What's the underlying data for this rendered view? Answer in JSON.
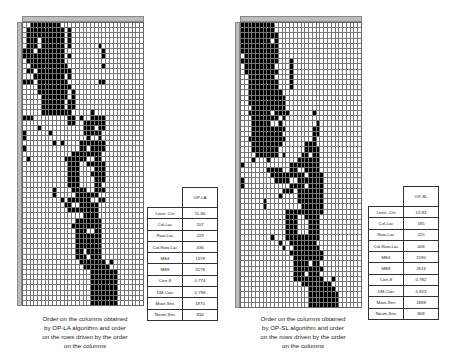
{
  "panels": [
    {
      "id": "op-la",
      "algorithm": "OP-LA",
      "matrix": {
        "cols": 32,
        "rows": 55,
        "runs": [
          [
            0,
            2,
            4
          ],
          [
            0,
            5,
            9
          ],
          [
            1,
            1,
            10
          ],
          [
            1,
            12,
            12
          ],
          [
            2,
            1,
            10
          ],
          [
            2,
            12,
            12
          ],
          [
            3,
            1,
            3
          ],
          [
            3,
            5,
            10
          ],
          [
            3,
            12,
            12
          ],
          [
            4,
            1,
            3
          ],
          [
            4,
            5,
            10
          ],
          [
            4,
            12,
            12
          ],
          [
            4,
            20,
            20
          ],
          [
            5,
            0,
            2
          ],
          [
            5,
            4,
            10
          ],
          [
            5,
            21,
            21
          ],
          [
            6,
            0,
            10
          ],
          [
            6,
            12,
            12
          ],
          [
            6,
            21,
            21
          ],
          [
            7,
            1,
            10
          ],
          [
            8,
            2,
            11
          ],
          [
            8,
            21,
            21
          ],
          [
            9,
            1,
            2
          ],
          [
            9,
            4,
            12
          ],
          [
            10,
            3,
            10
          ],
          [
            10,
            12,
            12
          ],
          [
            11,
            0,
            2
          ],
          [
            11,
            4,
            11
          ],
          [
            11,
            20,
            21
          ],
          [
            12,
            4,
            12
          ],
          [
            13,
            4,
            11
          ],
          [
            13,
            13,
            13
          ],
          [
            14,
            5,
            10
          ],
          [
            14,
            11,
            11
          ],
          [
            14,
            13,
            13
          ],
          [
            15,
            5,
            10
          ],
          [
            15,
            12,
            13
          ],
          [
            16,
            5,
            10
          ],
          [
            16,
            12,
            13
          ],
          [
            17,
            5,
            12
          ],
          [
            17,
            18,
            18
          ],
          [
            18,
            0,
            2
          ],
          [
            18,
            12,
            13
          ],
          [
            18,
            15,
            15
          ],
          [
            18,
            18,
            21
          ],
          [
            19,
            12,
            13
          ],
          [
            19,
            16,
            21
          ],
          [
            20,
            4,
            4
          ],
          [
            20,
            16,
            18
          ],
          [
            20,
            20,
            21
          ],
          [
            21,
            0,
            0
          ],
          [
            21,
            7,
            7
          ],
          [
            21,
            16,
            20
          ],
          [
            22,
            0,
            0
          ],
          [
            22,
            17,
            17
          ],
          [
            22,
            20,
            20
          ],
          [
            23,
            8,
            8
          ],
          [
            23,
            10,
            10
          ],
          [
            23,
            15,
            21
          ],
          [
            24,
            0,
            0
          ],
          [
            24,
            15,
            16
          ],
          [
            24,
            18,
            21
          ],
          [
            25,
            13,
            20
          ],
          [
            26,
            1,
            1
          ],
          [
            26,
            11,
            16
          ],
          [
            26,
            19,
            20
          ],
          [
            27,
            12,
            14
          ],
          [
            27,
            17,
            21
          ],
          [
            28,
            12,
            14
          ],
          [
            28,
            19,
            21
          ],
          [
            29,
            12,
            14
          ],
          [
            29,
            18,
            21
          ],
          [
            30,
            12,
            14
          ],
          [
            30,
            19,
            21
          ],
          [
            31,
            12,
            14
          ],
          [
            31,
            19,
            20
          ],
          [
            32,
            8,
            8
          ],
          [
            32,
            13,
            16
          ],
          [
            32,
            19,
            21
          ],
          [
            33,
            8,
            8
          ],
          [
            33,
            14,
            19
          ],
          [
            34,
            10,
            10
          ],
          [
            34,
            12,
            17
          ],
          [
            34,
            20,
            21
          ],
          [
            35,
            11,
            12
          ],
          [
            35,
            15,
            19
          ],
          [
            36,
            12,
            19
          ],
          [
            37,
            16,
            19
          ],
          [
            38,
            14,
            20
          ],
          [
            39,
            13,
            14
          ],
          [
            39,
            15,
            20
          ],
          [
            40,
            14,
            16
          ],
          [
            40,
            19,
            20
          ],
          [
            41,
            14,
            20
          ],
          [
            42,
            14,
            20
          ],
          [
            43,
            14,
            20
          ],
          [
            44,
            14,
            15
          ],
          [
            44,
            17,
            20
          ],
          [
            45,
            14,
            16
          ],
          [
            45,
            18,
            20
          ],
          [
            46,
            15,
            21
          ],
          [
            46,
            23,
            23
          ],
          [
            47,
            16,
            22
          ],
          [
            48,
            18,
            24
          ],
          [
            49,
            18,
            24
          ],
          [
            50,
            18,
            24
          ],
          [
            51,
            18,
            24
          ],
          [
            52,
            18,
            24
          ],
          [
            53,
            18,
            24
          ],
          [
            54,
            18,
            24
          ]
        ]
      },
      "table": {
        "header": "OP-LA",
        "rows": [
          {
            "label": "Lenn- Crit",
            "value": "11.66"
          },
          {
            "label": "Col-Lac",
            "value": "207"
          },
          {
            "label": "Row-Lac",
            "value": "229"
          },
          {
            "label": "Col-Row-Lac",
            "value": "436"
          },
          {
            "label": "ME4",
            "value": "1378"
          },
          {
            "label": "ME8",
            "value": "2578"
          },
          {
            "label": "Corr-8",
            "value": "0.774"
          },
          {
            "label": "DM-Corr",
            "value": "0.798"
          },
          {
            "label": "Moor-Strs",
            "value": "1970"
          },
          {
            "label": "Neum-Strs",
            "value": "834"
          }
        ]
      },
      "caption": [
        "Order on the columns obtained",
        "by OP-LA algorithm and order",
        "on the rows driven by the order",
        "on the columns"
      ]
    },
    {
      "id": "op-sl",
      "algorithm": "OP-SL",
      "matrix": {
        "cols": 32,
        "rows": 55,
        "runs": [
          [
            0,
            0,
            8
          ],
          [
            1,
            0,
            8
          ],
          [
            2,
            0,
            9
          ],
          [
            3,
            0,
            7
          ],
          [
            3,
            9,
            9
          ],
          [
            4,
            0,
            9
          ],
          [
            5,
            0,
            9
          ],
          [
            6,
            1,
            9
          ],
          [
            7,
            0,
            9
          ],
          [
            7,
            13,
            13
          ],
          [
            8,
            1,
            8
          ],
          [
            8,
            13,
            13
          ],
          [
            9,
            1,
            9
          ],
          [
            9,
            13,
            13
          ],
          [
            10,
            2,
            8
          ],
          [
            10,
            13,
            13
          ],
          [
            11,
            2,
            9
          ],
          [
            11,
            13,
            13
          ],
          [
            12,
            2,
            9
          ],
          [
            12,
            13,
            13
          ],
          [
            13,
            2,
            10
          ],
          [
            14,
            2,
            11
          ],
          [
            15,
            2,
            11
          ],
          [
            16,
            3,
            11
          ],
          [
            17,
            2,
            7
          ],
          [
            17,
            9,
            12
          ],
          [
            17,
            19,
            19
          ],
          [
            18,
            3,
            9
          ],
          [
            18,
            11,
            11
          ],
          [
            19,
            3,
            7
          ],
          [
            19,
            10,
            10
          ],
          [
            19,
            20,
            20
          ],
          [
            20,
            3,
            11
          ],
          [
            20,
            19,
            20
          ],
          [
            21,
            3,
            10
          ],
          [
            21,
            19,
            20
          ],
          [
            22,
            2,
            11
          ],
          [
            22,
            19,
            19
          ],
          [
            23,
            3,
            10
          ],
          [
            23,
            17,
            19
          ],
          [
            24,
            3,
            9
          ],
          [
            24,
            17,
            20
          ],
          [
            25,
            4,
            9
          ],
          [
            25,
            11,
            11
          ],
          [
            25,
            16,
            17
          ],
          [
            25,
            19,
            20
          ],
          [
            26,
            3,
            3
          ],
          [
            26,
            7,
            7
          ],
          [
            26,
            15,
            20
          ],
          [
            27,
            0,
            0
          ],
          [
            27,
            13,
            20
          ],
          [
            28,
            7,
            10
          ],
          [
            28,
            13,
            14
          ],
          [
            28,
            17,
            20
          ],
          [
            29,
            8,
            13
          ],
          [
            29,
            14,
            16
          ],
          [
            29,
            18,
            21
          ],
          [
            30,
            0,
            0
          ],
          [
            30,
            9,
            12
          ],
          [
            30,
            15,
            21
          ],
          [
            31,
            0,
            0
          ],
          [
            31,
            13,
            16
          ],
          [
            31,
            18,
            21
          ],
          [
            32,
            11,
            13
          ],
          [
            32,
            15,
            21
          ],
          [
            33,
            10,
            10
          ],
          [
            33,
            15,
            21
          ],
          [
            34,
            6,
            6
          ],
          [
            34,
            15,
            21
          ],
          [
            35,
            6,
            6
          ],
          [
            35,
            16,
            21
          ],
          [
            36,
            12,
            14
          ],
          [
            36,
            15,
            21
          ],
          [
            37,
            12,
            14
          ],
          [
            37,
            17,
            20
          ],
          [
            38,
            12,
            14
          ],
          [
            38,
            18,
            20
          ],
          [
            39,
            12,
            14
          ],
          [
            39,
            18,
            20
          ],
          [
            40,
            12,
            14
          ],
          [
            40,
            18,
            20
          ],
          [
            41,
            8,
            8
          ],
          [
            41,
            12,
            20
          ],
          [
            42,
            10,
            10
          ],
          [
            42,
            13,
            19
          ],
          [
            43,
            11,
            11
          ],
          [
            43,
            14,
            20
          ],
          [
            44,
            13,
            21
          ],
          [
            45,
            14,
            21
          ],
          [
            46,
            14,
            17
          ],
          [
            46,
            19,
            20
          ],
          [
            47,
            14,
            21
          ],
          [
            48,
            14,
            16
          ],
          [
            48,
            18,
            20
          ],
          [
            49,
            14,
            21
          ],
          [
            49,
            24,
            24
          ],
          [
            50,
            16,
            23
          ],
          [
            51,
            18,
            24
          ],
          [
            52,
            18,
            25
          ],
          [
            53,
            18,
            25
          ],
          [
            54,
            18,
            25
          ]
        ]
      },
      "table": {
        "header": "OP-SL",
        "rows": [
          {
            "label": "Lenn- Crit",
            "value": "12.83"
          },
          {
            "label": "Col-Lac",
            "value": "185"
          },
          {
            "label": "Row-Lac",
            "value": "225"
          },
          {
            "label": "Col-Row-Lac",
            "value": "408"
          },
          {
            "label": "ME4",
            "value": "1590"
          },
          {
            "label": "ME8",
            "value": "2616"
          },
          {
            "label": "Corr-8",
            "value": "0.782"
          },
          {
            "label": "DM-Corr",
            "value": "0.823"
          },
          {
            "label": "Moor-Strs",
            "value": "1888"
          },
          {
            "label": "Neum-Strs",
            "value": "808"
          }
        ]
      },
      "caption": [
        "Order on the columns obtained",
        "by OP-SL algorithm and order",
        "on the rows driven by the order",
        "on the columns"
      ]
    }
  ]
}
